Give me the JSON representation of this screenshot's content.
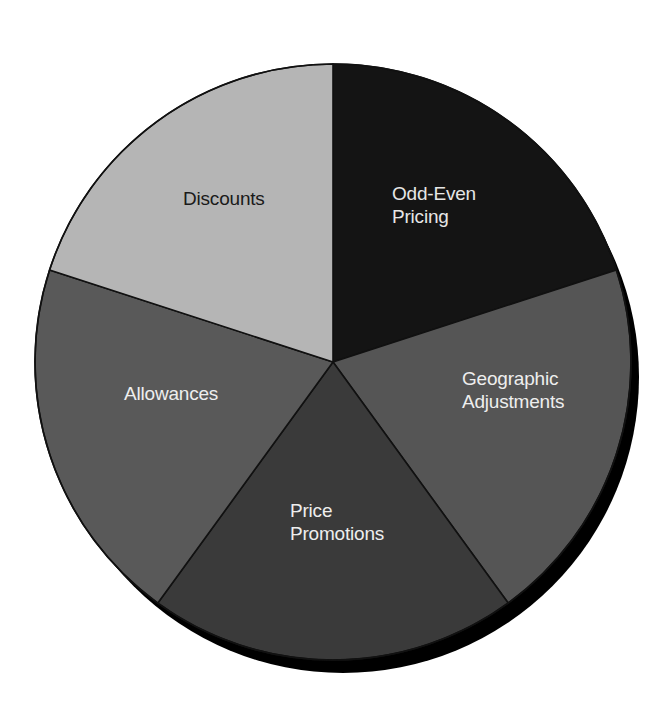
{
  "chart_data": {
    "type": "pie",
    "title": "",
    "start_angle_deg": -90,
    "direction": "clockwise",
    "categories": [
      "Odd-Even Pricing",
      "Geographic Adjustments",
      "Price Promotions",
      "Allowances",
      "Discounts"
    ],
    "values": [
      20,
      20,
      20,
      20,
      20
    ],
    "slices": [
      {
        "label": "Odd-Even Pricing",
        "lines": [
          "Odd-Even",
          "Pricing"
        ],
        "value": 20,
        "color": "#141414",
        "text_color": "#e6e6e6"
      },
      {
        "label": "Geographic Adjustments",
        "lines": [
          "Geographic",
          "Adjustments"
        ],
        "value": 20,
        "color": "#555555",
        "text_color": "#eeeeee"
      },
      {
        "label": "Price Promotions",
        "lines": [
          "Price",
          "Promotions"
        ],
        "value": 20,
        "color": "#3a3a3a",
        "text_color": "#eeeeee"
      },
      {
        "label": "Allowances",
        "lines": [
          "Allowances"
        ],
        "value": 20,
        "color": "#595959",
        "text_color": "#eeeeee"
      },
      {
        "label": "Discounts",
        "lines": [
          "Discounts"
        ],
        "value": 20,
        "color": "#b5b5b5",
        "text_color": "#1a1a1a"
      }
    ],
    "legend": "none (labels inside slices)",
    "shadow": {
      "color": "#000000",
      "dx": 10,
      "dy": 15
    },
    "outline_color": "#111111"
  },
  "layout": {
    "cx": 333,
    "cy": 362,
    "r": 298,
    "label_positions": [
      {
        "x": 392,
        "y": 200,
        "anchor": "start"
      },
      {
        "x": 462,
        "y": 385,
        "anchor": "start"
      },
      {
        "x": 290,
        "y": 517,
        "anchor": "start"
      },
      {
        "x": 124,
        "y": 400,
        "anchor": "start"
      },
      {
        "x": 183,
        "y": 205,
        "anchor": "start"
      }
    ]
  }
}
